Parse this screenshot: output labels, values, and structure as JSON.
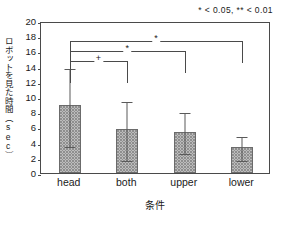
{
  "chart_data": {
    "type": "bar",
    "title": "",
    "subtitle": "",
    "xlabel": "条件",
    "ylabel": "ロボットを見た時間（sec）",
    "categories": [
      "head",
      "both",
      "upper",
      "lower"
    ],
    "values": [
      8.9,
      5.8,
      5.4,
      3.4
    ],
    "errors_upper": [
      14.0,
      9.6,
      8.2,
      5.0
    ],
    "errors_lower": [
      3.7,
      1.9,
      2.8,
      1.8
    ],
    "ylim": [
      0,
      20
    ],
    "ytick_step": 2,
    "yticks": [
      "20",
      "18",
      "16",
      "14",
      "12",
      "10",
      "8",
      "6",
      "4",
      "2",
      "0"
    ],
    "grid": false,
    "legend_position": "top-right",
    "legend_note": "* < 0.05, ** < 0.01",
    "annotations": [
      {
        "from": "head",
        "to": "both",
        "mark": "+",
        "level": 1
      },
      {
        "from": "head",
        "to": "upper",
        "mark": "*",
        "level": 2
      },
      {
        "from": "head",
        "to": "lower",
        "mark": "*",
        "level": 3
      }
    ]
  }
}
